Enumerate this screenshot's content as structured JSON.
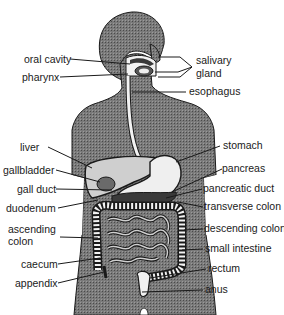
{
  "diagram": {
    "colors": {
      "body_fill": "#6e6e6e",
      "organ_fill": "#e8e8e8",
      "outline": "#1a1a1a",
      "background": "#ffffff"
    },
    "labels_left": [
      {
        "id": "oral-cavity",
        "text": "oral cavity"
      },
      {
        "id": "pharynx",
        "text": "pharynx"
      },
      {
        "id": "liver",
        "text": "liver"
      },
      {
        "id": "gallbladder",
        "text": "gallbladder"
      },
      {
        "id": "gall-duct",
        "text": "gall duct"
      },
      {
        "id": "duodenum",
        "text": "duodenum"
      },
      {
        "id": "ascending-colon-1",
        "text": "ascending"
      },
      {
        "id": "ascending-colon-2",
        "text": "colon"
      },
      {
        "id": "caecum",
        "text": "caecum"
      },
      {
        "id": "appendix",
        "text": "appendix"
      }
    ],
    "labels_right": [
      {
        "id": "salivary-gland-1",
        "text": "salivary"
      },
      {
        "id": "salivary-gland-2",
        "text": "gland"
      },
      {
        "id": "esophagus",
        "text": "esophagus"
      },
      {
        "id": "stomach",
        "text": "stomach"
      },
      {
        "id": "pancreas",
        "text": "pancreas"
      },
      {
        "id": "pancreatic-duct",
        "text": "pancreatic duct"
      },
      {
        "id": "transverse-colon",
        "text": "transverse colon"
      },
      {
        "id": "descending-colon",
        "text": "descending colon"
      },
      {
        "id": "small-intestine",
        "text": "small intestine"
      },
      {
        "id": "rectum",
        "text": "rectum"
      },
      {
        "id": "anus",
        "text": "anus"
      }
    ]
  }
}
